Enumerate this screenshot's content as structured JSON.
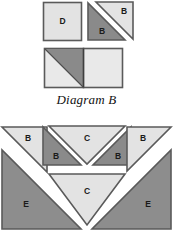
{
  "figure": {
    "caption": "Diagram B",
    "colors": {
      "background": "#ffffff",
      "light_gray": "#e3e3e3",
      "mid_gray": "#8d8d8d",
      "dark_gray": "#7f7f7f",
      "outline": "#5a5a5a",
      "label_text": "#1a1a1a"
    }
  },
  "top_group": {
    "pieces": [
      {
        "label": "D",
        "shape": "square",
        "fill": "light"
      },
      {
        "label": "B",
        "shape": "triangle",
        "fill": "dark"
      },
      {
        "label": "B",
        "shape": "triangle",
        "fill": "light"
      }
    ],
    "assembled_unit": {
      "shape": "rectangle",
      "left_square_fill": "light",
      "left_square_triangle_fill": "dark",
      "right_square_fill": "light"
    }
  },
  "bottom_group": {
    "pieces": [
      {
        "label": "B",
        "shape": "triangle",
        "fill": "light"
      },
      {
        "label": "B",
        "shape": "triangle",
        "fill": "dark"
      },
      {
        "label": "C",
        "shape": "triangle",
        "fill": "light"
      },
      {
        "label": "B",
        "shape": "triangle",
        "fill": "dark"
      },
      {
        "label": "B",
        "shape": "triangle",
        "fill": "light"
      },
      {
        "label": "E",
        "shape": "triangle",
        "fill": "mid"
      },
      {
        "label": "C",
        "shape": "triangle",
        "fill": "light"
      },
      {
        "label": "E",
        "shape": "triangle",
        "fill": "mid"
      }
    ]
  },
  "labels": {
    "b_top_dark": "B",
    "b_top_light": "B",
    "d_square": "D",
    "b_lower_left_outer": "B",
    "b_lower_left_inner": "B",
    "c_upper": "C",
    "b_lower_right_inner": "B",
    "b_lower_right_outer": "B",
    "e_left": "E",
    "c_lower": "C",
    "e_right": "E"
  }
}
